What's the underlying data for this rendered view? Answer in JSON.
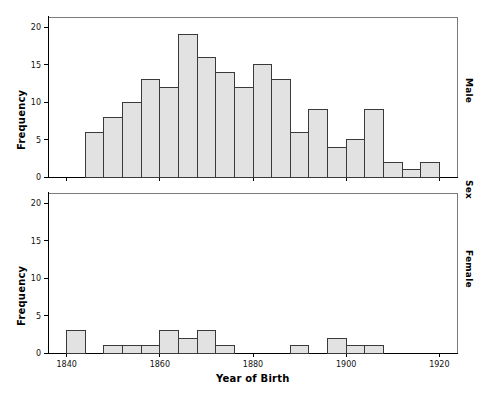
{
  "figure": {
    "xlabel": "Year of Birth",
    "ylabel_top": "Frequency",
    "ylabel_bottom": "Frequency",
    "panel_group_label": "Sex",
    "panel_top_label": "Male",
    "panel_bottom_label": "Female",
    "bar_fill": "#e2e2e2",
    "bar_stroke": "#3a3a3a",
    "frame_stroke": "#7b7b7b",
    "axis_stroke": "#000000"
  },
  "chart_data": {
    "type": "bar",
    "title": "",
    "xlabel": "Year of Birth",
    "ylabel": "Frequency",
    "xlim": [
      1836,
      1924
    ],
    "ylim": [
      0,
      21
    ],
    "xticks": [
      1840,
      1860,
      1880,
      1900,
      1920
    ],
    "xticklabels": [
      "1840",
      "1860",
      "1880",
      "1900",
      "1920"
    ],
    "yticks": [
      0,
      5,
      10,
      15,
      20
    ],
    "yticklabels": [
      "0",
      "5",
      "10",
      "15",
      "20"
    ],
    "bin_width": 4,
    "grid": false,
    "legend": "none",
    "panels": [
      {
        "name": "Male",
        "bins": [
          {
            "start": 1844,
            "end": 1848,
            "value": 6
          },
          {
            "start": 1848,
            "end": 1852,
            "value": 8
          },
          {
            "start": 1852,
            "end": 1856,
            "value": 10
          },
          {
            "start": 1856,
            "end": 1860,
            "value": 13
          },
          {
            "start": 1860,
            "end": 1864,
            "value": 12
          },
          {
            "start": 1864,
            "end": 1868,
            "value": 19
          },
          {
            "start": 1868,
            "end": 1872,
            "value": 16
          },
          {
            "start": 1872,
            "end": 1876,
            "value": 14
          },
          {
            "start": 1876,
            "end": 1880,
            "value": 12
          },
          {
            "start": 1880,
            "end": 1884,
            "value": 15
          },
          {
            "start": 1884,
            "end": 1888,
            "value": 13
          },
          {
            "start": 1888,
            "end": 1892,
            "value": 6
          },
          {
            "start": 1892,
            "end": 1896,
            "value": 9
          },
          {
            "start": 1896,
            "end": 1900,
            "value": 4
          },
          {
            "start": 1900,
            "end": 1904,
            "value": 5
          },
          {
            "start": 1904,
            "end": 1908,
            "value": 9
          },
          {
            "start": 1908,
            "end": 1912,
            "value": 2
          },
          {
            "start": 1912,
            "end": 1916,
            "value": 1
          },
          {
            "start": 1916,
            "end": 1920,
            "value": 2
          }
        ]
      },
      {
        "name": "Female",
        "bins": [
          {
            "start": 1840,
            "end": 1844,
            "value": 3
          },
          {
            "start": 1848,
            "end": 1852,
            "value": 1
          },
          {
            "start": 1852,
            "end": 1856,
            "value": 1
          },
          {
            "start": 1856,
            "end": 1860,
            "value": 1
          },
          {
            "start": 1860,
            "end": 1864,
            "value": 3
          },
          {
            "start": 1864,
            "end": 1868,
            "value": 2
          },
          {
            "start": 1868,
            "end": 1872,
            "value": 3
          },
          {
            "start": 1872,
            "end": 1876,
            "value": 1
          },
          {
            "start": 1888,
            "end": 1892,
            "value": 1
          },
          {
            "start": 1896,
            "end": 1900,
            "value": 2
          },
          {
            "start": 1900,
            "end": 1904,
            "value": 1
          },
          {
            "start": 1904,
            "end": 1908,
            "value": 1
          }
        ]
      }
    ]
  }
}
